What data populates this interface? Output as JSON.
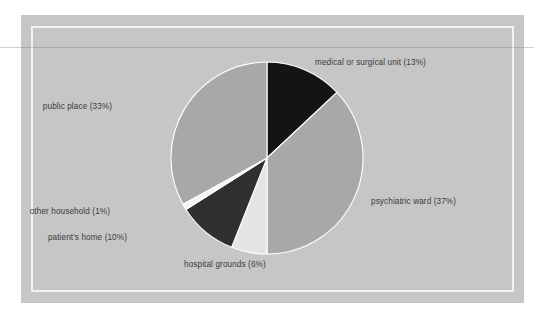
{
  "figure": {
    "background_color": "#ffffff",
    "panel_color": "#c6c6c6",
    "inner_frame_color": "#f2f2f2",
    "label_color": "#3b3b3b"
  },
  "chart_data": {
    "type": "pie",
    "title": "",
    "subtitle": "",
    "xlabel": "",
    "ylabel": "",
    "legend_position": "none",
    "grid": false,
    "start_angle_deg": 0,
    "direction": "clockwise",
    "categories": [
      "medical or surgical unit",
      "psychiatric ward",
      "hospital grounds",
      "patient's home",
      "other household",
      "public place"
    ],
    "values": [
      13,
      37,
      6,
      10,
      1,
      33
    ],
    "units": "%",
    "slices": [
      {
        "name": "medical or surgical unit",
        "value": 13,
        "label": "medical or surgical unit (13%)",
        "color": "#141414",
        "label_x": 315,
        "label_y": 58,
        "align": "right"
      },
      {
        "name": "psychiatric ward",
        "value": 37,
        "label": "psychiatric ward (37%)",
        "color": "#a8a8a8",
        "label_x": 371,
        "label_y": 197,
        "align": "right"
      },
      {
        "name": "hospital grounds",
        "value": 6,
        "label": "hospital grounds (6%)",
        "color": "#e4e4e4",
        "label_x": 184,
        "label_y": 260,
        "align": "right"
      },
      {
        "name": "patient's home",
        "value": 10,
        "label": "patient's home (10%)",
        "color": "#303030",
        "label_x": 127,
        "label_y": 233,
        "align": "left"
      },
      {
        "name": "other household",
        "value": 1,
        "label": "other household (1%)",
        "color": "#f4f4f4",
        "label_x": 110,
        "label_y": 207,
        "align": "left"
      },
      {
        "name": "public place",
        "value": 33,
        "label": "public place (33%)",
        "color": "#a8a8a8",
        "label_x": 112,
        "label_y": 102,
        "align": "left"
      }
    ],
    "geometry": {
      "center_x": 267,
      "center_y": 158,
      "radius": 96
    }
  }
}
